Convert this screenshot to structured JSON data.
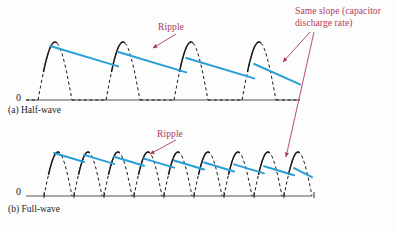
{
  "figure": {
    "colors": {
      "ripple_line": "#2a9ed6",
      "waveform": "#1b1b1b",
      "annotation": "#b03a5b",
      "axis": "#555555",
      "background": "#fdfdfd"
    },
    "annotations": {
      "same_slope_line1": "Same slope (capacitor",
      "same_slope_line2": "discharge rate)",
      "ripple_half": "Ripple",
      "ripple_full": "Ripple"
    },
    "panels": [
      {
        "id": "half-wave",
        "caption": "(a) Half-wave",
        "zero_label": "0",
        "baseline_y": 100,
        "peak_y": 42,
        "num_humps": 4,
        "hump_start_x": 38,
        "hump_period": 68,
        "hump_width": 34,
        "ripple_start_y": 46,
        "ripple_end_y": 70,
        "ripple_segments": 4,
        "axis_start_x": 26,
        "axis_end_x": 300
      },
      {
        "id": "full-wave",
        "caption": "(b) Full-wave",
        "zero_label": "0",
        "baseline_y": 196,
        "peak_y": 152,
        "num_humps": 9,
        "hump_start_x": 44,
        "hump_period": 30,
        "hump_width": 28,
        "ripple_start_y": 153,
        "ripple_end_y": 170,
        "ripple_segments": 9,
        "axis_start_x": 26,
        "axis_end_x": 312
      }
    ],
    "arrows": [
      {
        "name": "ripple-arrow-half",
        "x1": 176,
        "y1": 34,
        "x2": 153,
        "y2": 48
      },
      {
        "name": "ripple-arrow-full",
        "x1": 176,
        "y1": 140,
        "x2": 150,
        "y2": 154
      },
      {
        "name": "same-slope-arrow-half",
        "x1": 310,
        "y1": 32,
        "x2": 283,
        "y2": 62
      },
      {
        "name": "same-slope-arrow-full",
        "x1": 314,
        "y1": 32,
        "x2": 286,
        "y2": 157
      }
    ]
  },
  "chart_data": {
    "type": "line",
    "xlabel": "",
    "ylabel": "",
    "series": [
      {
        "name": "Half-wave rectified sine (unfiltered)",
        "style": "dashed",
        "color": "#1b1b1b",
        "peaks": 4,
        "description": "Four half-sine humps separated by flat zero intervals"
      },
      {
        "name": "Half-wave filtered output (ripple)",
        "style": "solid",
        "color": "#2a9ed6",
        "segments": 4,
        "description": "Sawtooth ripple decaying from each peak at constant capacitor discharge slope"
      },
      {
        "name": "Full-wave rectified sine (unfiltered)",
        "style": "dashed",
        "color": "#1b1b1b",
        "peaks": 9,
        "description": "Nine adjacent half-sine humps with no flat intervals"
      },
      {
        "name": "Full-wave filtered output (ripple)",
        "style": "solid",
        "color": "#2a9ed6",
        "segments": 9,
        "description": "Smaller sawtooth ripple, same discharge slope, shorter discharge time"
      }
    ],
    "annotations": [
      "Ripple",
      "Ripple",
      "Same slope (capacitor discharge rate)"
    ]
  }
}
